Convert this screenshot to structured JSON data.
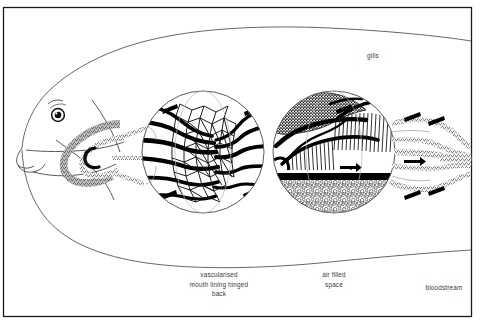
{
  "figure": {
    "kind": "scientific-illustration",
    "background_color": "#ffffff",
    "ink_color": "#000000",
    "frame": {
      "visible": true,
      "color": "#1a1a1a",
      "x": 3,
      "y": 7,
      "width": 469,
      "height": 310
    },
    "labels": [
      {
        "id": "gills",
        "text": "gills",
        "x": 373,
        "y": 58,
        "align": "middle"
      },
      {
        "id": "vascularised-mouth-lining",
        "lines": [
          "vascularised",
          "mouth lining hinged",
          "back"
        ],
        "x": 219,
        "y": 277,
        "line_height": 9.5,
        "align": "middle"
      },
      {
        "id": "air-filled-space",
        "lines": [
          "air filled",
          "space"
        ],
        "x": 334,
        "y": 277,
        "line_height": 9.5,
        "align": "middle"
      },
      {
        "id": "bloodstream",
        "text": "bloodstream",
        "x": 444,
        "y": 290,
        "align": "middle"
      }
    ],
    "insets": [
      {
        "id": "inset-vascular",
        "caption_ref": "vascularised-mouth-lining",
        "cx": 203,
        "cy": 152,
        "r": 61,
        "content": "branching capillary network of vascularised mouth lining"
      },
      {
        "id": "inset-gill",
        "caption_ref": "air-filled-space",
        "cx": 334,
        "cy": 152,
        "r": 61,
        "content": "gill filaments above a black septum with air filled bubble space below"
      }
    ],
    "flow_arrows": {
      "count": 10,
      "color": "#000000",
      "meaning": "direction of blood and water flow"
    },
    "vessel_texture": "stippled",
    "eye": {
      "cx": 58,
      "cy": 115,
      "r": 6.5
    }
  }
}
